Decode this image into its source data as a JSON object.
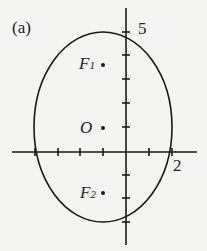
{
  "figure": {
    "panel_label": "(a)",
    "y_tick_label": "5",
    "x_tick_label": "2",
    "origin_label": "O",
    "focus1": {
      "letter": "F",
      "sub": "1"
    },
    "focus2": {
      "letter": "F",
      "sub": "2"
    },
    "ellipse": {
      "center": [
        -1,
        1
      ],
      "semi_major_vertical": 4,
      "semi_minor_horizontal": 3
    },
    "stroke_color": "#1a1a1a",
    "background_color": "#f4f4f2"
  }
}
